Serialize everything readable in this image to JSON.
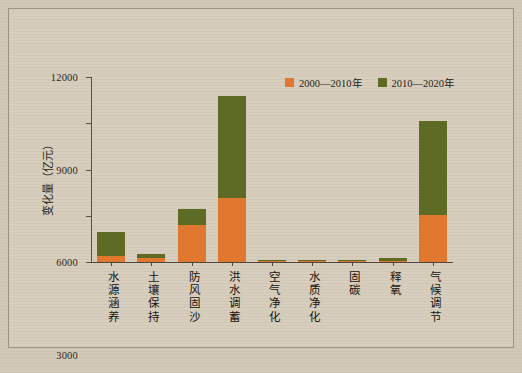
{
  "chart_data": {
    "type": "bar",
    "stacked": true,
    "title": "",
    "xlabel": "",
    "ylabel": "变化量（亿元）",
    "ylim": [
      0,
      12000
    ],
    "yticks": [
      0,
      3000,
      6000,
      9000,
      12000
    ],
    "ytick_labels": [
      "0",
      "3000",
      "6000",
      "9000",
      "12000"
    ],
    "grid": false,
    "legend_position": "top-right",
    "categories": [
      "水源涵养",
      "土壤保持",
      "防风固沙",
      "洪水调蓄",
      "空气净化",
      "水质净化",
      "固碳",
      "释氧",
      "气候调节"
    ],
    "series": [
      {
        "name": "2000—2010年",
        "color": "#e0792f",
        "values": [
          400,
          250,
          2400,
          4150,
          30,
          20,
          30,
          40,
          3050
        ]
      },
      {
        "name": "2010—2020年",
        "color": "#5e6b25",
        "values": [
          1550,
          300,
          1050,
          6600,
          60,
          60,
          90,
          190,
          6100
        ]
      }
    ],
    "totals": [
      1950,
      550,
      3450,
      10750,
      90,
      80,
      120,
      230,
      9150
    ]
  },
  "legend": {
    "items": [
      {
        "label": "2000—2010年",
        "color": "#e0792f",
        "swatch": "legend-swatch-orange"
      },
      {
        "label": "2010—2020年",
        "color": "#5e6b25",
        "swatch": "legend-swatch-green"
      }
    ]
  },
  "axes": {
    "y_title": "变化量（亿元）"
  },
  "caption": ""
}
